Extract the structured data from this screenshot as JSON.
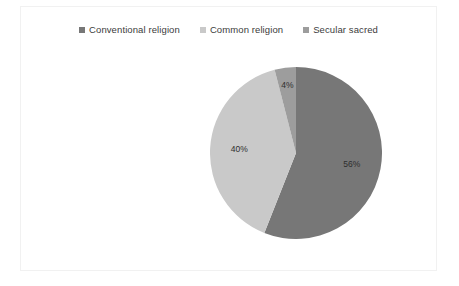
{
  "chart_data": {
    "type": "pie",
    "title": "",
    "categories": [
      "Conventional religion",
      "Common religion",
      "Secular sacred"
    ],
    "values": [
      56,
      40,
      4
    ],
    "data_labels": [
      "56%",
      "40%",
      "4%"
    ],
    "colors": [
      "#777777",
      "#c9c9c9",
      "#9d9d9d"
    ],
    "legend_position": "top",
    "start_angle_deg": 0,
    "direction": "clockwise",
    "unit": "%"
  },
  "legend": {
    "items": [
      {
        "label": "Conventional religion",
        "color": "#777777",
        "marker": "square-marker"
      },
      {
        "label": "Common religion",
        "color": "#c9c9c9",
        "marker": "square-marker"
      },
      {
        "label": "Secular sacred",
        "color": "#9d9d9d",
        "marker": "square-marker"
      }
    ]
  },
  "slices": [
    {
      "name": "Conventional religion",
      "label": "56%",
      "value": 56,
      "color": "#777777"
    },
    {
      "name": "Common religion",
      "label": "40%",
      "value": 40,
      "color": "#c9c9c9"
    },
    {
      "name": "Secular sacred",
      "label": "4%",
      "value": 4,
      "color": "#9d9d9d"
    }
  ],
  "frame": {
    "border_color": "#f1f1f1",
    "background": "#ffffff"
  }
}
